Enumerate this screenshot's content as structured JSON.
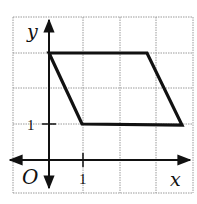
{
  "figure": {
    "type": "coordinate-grid-parallelogram",
    "axis_labels": {
      "x": "x",
      "y": "y",
      "origin": "O"
    },
    "tick_labels": {
      "x_one": "1",
      "y_one": "1"
    },
    "grid": {
      "x_range": [
        -1,
        4
      ],
      "y_range": [
        -1,
        4
      ],
      "cell_size_units": 1
    },
    "shape": {
      "name": "parallelogram",
      "vertices": [
        [
          0,
          3
        ],
        [
          2.7,
          3
        ],
        [
          3.7,
          1
        ],
        [
          1,
          1
        ]
      ]
    },
    "colors": {
      "grid": "#9a9a9a",
      "axes": "#111111",
      "shape": "#111111",
      "background": "#ffffff"
    }
  }
}
